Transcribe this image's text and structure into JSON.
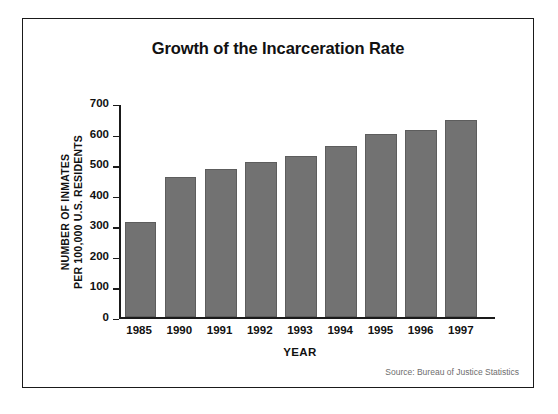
{
  "figure": {
    "source_note": "Source: Bureau of Justice Statistics"
  },
  "chart_data": {
    "type": "bar",
    "title": "Growth of the Incarceration Rate",
    "xlabel": "YEAR",
    "ylabel_line1": "NUMBER OF INMATES",
    "ylabel_line2": "PER 100,000 U.S. RESIDENTS",
    "categories": [
      "1985",
      "1990",
      "1991",
      "1992",
      "1993",
      "1994",
      "1995",
      "1996",
      "1997"
    ],
    "values": [
      313,
      463,
      488,
      512,
      531,
      564,
      606,
      618,
      652
    ],
    "ylim": [
      0,
      700
    ],
    "yticks": [
      0,
      100,
      200,
      300,
      400,
      500,
      600,
      700
    ],
    "ytick_labels": [
      "0",
      "100",
      "200",
      "300",
      "400",
      "500",
      "600",
      "700"
    ],
    "grid": false,
    "legend": false,
    "bar_color": "#727272",
    "axis_color": "#1a1a1a"
  }
}
